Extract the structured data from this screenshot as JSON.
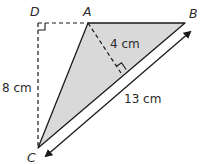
{
  "diagram": {
    "type": "geometry-triangle",
    "colors": {
      "fill": "#d9d9d9",
      "stroke": "#1a1a1a",
      "text": "#2b2b2b"
    },
    "points": {
      "D": "D",
      "A": "A",
      "B": "B",
      "C": "C"
    },
    "measurements": {
      "height_AC_perp": "4 cm",
      "DC": "8 cm",
      "CB": "13 cm"
    },
    "right_angles": [
      "D",
      "foot of perpendicular from A to CB"
    ],
    "shaded_region": "triangle ABC",
    "dashed_lines": [
      "DA",
      "DC",
      "A to CB perpendicular"
    ]
  }
}
